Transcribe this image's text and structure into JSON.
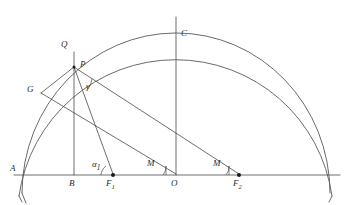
{
  "figure": {
    "type": "geometric-diagram",
    "background_color": "#ffffff",
    "line_color": "#4a4a4a",
    "arc_color": "#5a5a5a",
    "point_color": "#1a1a1a"
  },
  "labels": {
    "A": "A",
    "B": "B",
    "C": "C",
    "G": "G",
    "P": "P",
    "Q": "Q",
    "O": "O",
    "F1_main": "F",
    "F1_sub": "1",
    "F2_main": "F",
    "F2_sub": "2",
    "alpha_main": "α",
    "alpha_sub": "1",
    "gamma": "γ",
    "M_left": "M",
    "M_right": "M"
  },
  "geometry": {
    "baseline_y": 175,
    "axis_start_x": 14,
    "axis_end_x": 340,
    "center_x": 176,
    "outer_radius": 158,
    "inner_radius": 143,
    "points": {
      "A": {
        "x": 18,
        "y": 175
      },
      "B": {
        "x": 74,
        "y": 175
      },
      "F1": {
        "x": 113,
        "y": 175
      },
      "O": {
        "x": 176,
        "y": 175
      },
      "F2": {
        "x": 239,
        "y": 175
      },
      "P": {
        "x": 74,
        "y": 67
      },
      "Q": {
        "x": 74,
        "y": 52
      },
      "C": {
        "x": 176,
        "y": 32
      },
      "G": {
        "x": 41,
        "y": 93
      },
      "apex": {
        "x": 176,
        "y": 17
      }
    },
    "segments": [
      {
        "name": "baseline",
        "from": "axis_start",
        "to": "axis_end"
      },
      {
        "name": "vertical-BQ",
        "from": "B",
        "to": "Q"
      },
      {
        "name": "vertical-OC-apex",
        "from": "O",
        "to": "apex"
      },
      {
        "name": "P-to-F1",
        "from": "P",
        "to": "F1"
      },
      {
        "name": "P-to-F2",
        "from": "P",
        "to": "F2"
      },
      {
        "name": "P-to-G",
        "from": "P",
        "to": "G"
      },
      {
        "name": "G-to-O",
        "from": "G",
        "to": "O"
      }
    ],
    "angles": [
      {
        "name": "alpha1",
        "vertex": "F1",
        "label": "α"
      },
      {
        "name": "gamma",
        "vertex": "P",
        "label": "γ"
      },
      {
        "name": "M-at-O",
        "vertex": "O",
        "label": "M"
      },
      {
        "name": "M-at-F2",
        "vertex": "F2",
        "label": "M"
      }
    ]
  },
  "label_positions": {
    "A": {
      "x": 10,
      "y": 169
    },
    "B": {
      "x": 69,
      "y": 179
    },
    "C": {
      "x": 180,
      "y": 29
    },
    "G": {
      "x": 28,
      "y": 85
    },
    "P": {
      "x": 80,
      "y": 61
    },
    "Q": {
      "x": 62,
      "y": 41
    },
    "O": {
      "x": 172,
      "y": 179
    },
    "F1": {
      "x": 107,
      "y": 179
    },
    "F2": {
      "x": 234,
      "y": 179
    },
    "alpha": {
      "x": 93,
      "y": 161
    },
    "gamma": {
      "x": 86,
      "y": 83
    },
    "M_left": {
      "x": 148,
      "y": 160
    },
    "M_right": {
      "x": 214,
      "y": 160
    }
  }
}
